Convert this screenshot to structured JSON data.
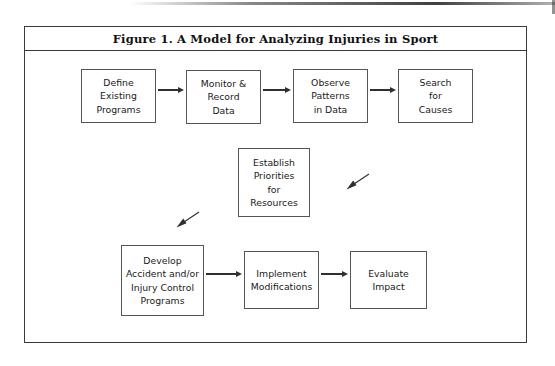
{
  "figure": {
    "title": "Figure 1. A Model for Analyzing Injuries in Sport",
    "frame_color": "#3a3a3a",
    "box_border_color": "#555555",
    "arrow_color": "#303030",
    "background": "#ffffff"
  },
  "nodes": [
    {
      "id": "define-existing-programs",
      "lines": [
        "Define",
        "Existing",
        "Programs"
      ],
      "x": 56,
      "y": 18,
      "w": 75,
      "h": 54
    },
    {
      "id": "monitor-record-data",
      "lines": [
        "Monitor &",
        "Record",
        "Data"
      ],
      "x": 161,
      "y": 19,
      "w": 75,
      "h": 54
    },
    {
      "id": "observe-patterns-in-data",
      "lines": [
        "Observe",
        "Patterns",
        "in Data"
      ],
      "x": 268,
      "y": 18,
      "w": 75,
      "h": 54
    },
    {
      "id": "search-for-causes",
      "lines": [
        "Search",
        "for",
        "Causes"
      ],
      "x": 373,
      "y": 18,
      "w": 75,
      "h": 54
    },
    {
      "id": "establish-priorities-for-resources",
      "lines": [
        "Establish",
        "Priorities",
        "for",
        "Resources"
      ],
      "x": 213,
      "y": 97,
      "w": 72,
      "h": 69
    },
    {
      "id": "develop-accident-injury-control-programs",
      "lines": [
        "Develop",
        "Accident and/or",
        "Injury Control",
        "Programs"
      ],
      "x": 96,
      "y": 194,
      "w": 83,
      "h": 71
    },
    {
      "id": "implement-modifications",
      "lines": [
        "Implement",
        "Modifications"
      ],
      "x": 219,
      "y": 200,
      "w": 75,
      "h": 58
    },
    {
      "id": "evaluate-impact",
      "lines": [
        "Evaluate",
        "Impact"
      ],
      "x": 325,
      "y": 200,
      "w": 77,
      "h": 58
    }
  ],
  "connectors": [
    {
      "id": "define-to-monitor",
      "x": 133,
      "y": 39,
      "w": 26
    },
    {
      "id": "monitor-to-observe",
      "x": 238,
      "y": 39,
      "w": 28
    },
    {
      "id": "observe-to-search",
      "x": 345,
      "y": 39,
      "w": 26
    },
    {
      "id": "develop-to-implement",
      "x": 181,
      "y": 223,
      "w": 36
    },
    {
      "id": "implement-to-evaluate",
      "x": 296,
      "y": 223,
      "w": 27
    }
  ],
  "flow_arrows": [
    {
      "id": "search-to-establish-diagonal",
      "x": 320,
      "y": 122
    },
    {
      "id": "establish-to-develop-diagonal",
      "x": 150,
      "y": 160
    }
  ]
}
